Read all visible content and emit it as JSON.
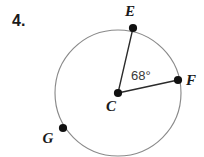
{
  "problem": {
    "number": "4."
  },
  "figure": {
    "type": "circle-with-central-angle",
    "circle": {
      "center_label": "C",
      "center_x": 118,
      "center_y": 93,
      "radius": 63,
      "stroke_color": "#8a8a8a"
    },
    "points": [
      {
        "label": "E",
        "x": 133,
        "y": 28,
        "label_x": 130,
        "label_y": 16,
        "on_circle": true
      },
      {
        "label": "F",
        "x": 178,
        "y": 80,
        "label_x": 186,
        "label_y": 85,
        "on_circle": true
      },
      {
        "label": "C",
        "x": 118,
        "y": 93,
        "label_x": 111,
        "label_y": 111,
        "on_circle": false
      },
      {
        "label": "G",
        "x": 63,
        "y": 128,
        "label_x": 48,
        "label_y": 143,
        "on_circle": true
      }
    ],
    "radii": [
      {
        "from": "C",
        "to": "E"
      },
      {
        "from": "C",
        "to": "F"
      }
    ],
    "angle": {
      "value": "68°",
      "vertex": "C",
      "rays": [
        "E",
        "F"
      ],
      "label_x": 131,
      "label_y": 80,
      "color": "#3a3a3a"
    }
  }
}
